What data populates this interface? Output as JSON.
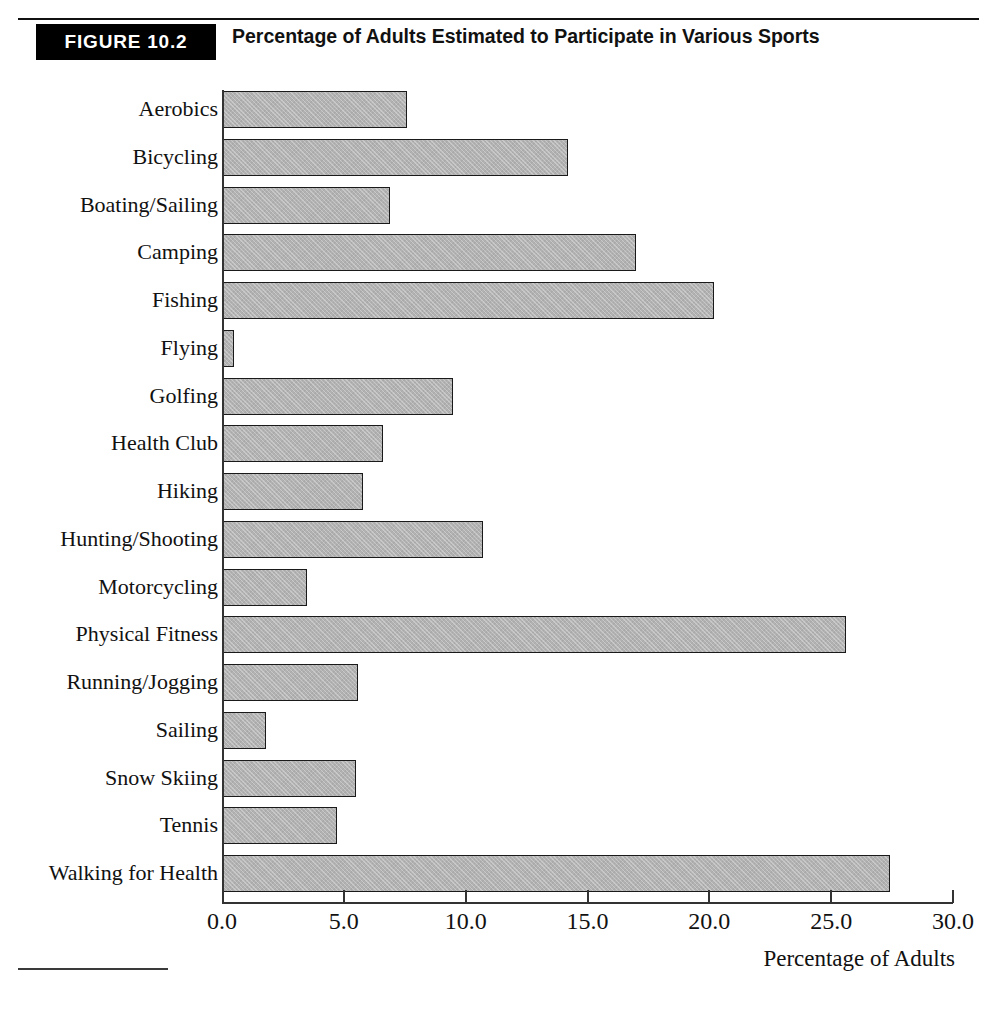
{
  "figure": {
    "badge": "FIGURE 10.2",
    "title": "Percentage of Adults Estimated to Participate in Various Sports"
  },
  "axis": {
    "x_title": "Percentage of Adults",
    "tick_labels": [
      "0.0",
      "5.0",
      "10.0",
      "15.0",
      "20.0",
      "25.0",
      "30.0"
    ]
  },
  "colors": {
    "bar_fill": "#b2b2b2",
    "bar_border": "#1a1a1a",
    "badge_background": "#000000",
    "badge_text": "#ffffff",
    "axis": "#333333",
    "text": "#111111"
  },
  "chart_data": {
    "type": "bar",
    "orientation": "horizontal",
    "title": "Percentage of Adults Estimated to Participate in Various Sports",
    "xlabel": "Percentage of Adults",
    "ylabel": "",
    "xlim": [
      0.0,
      30.0
    ],
    "xticks": [
      0.0,
      5.0,
      10.0,
      15.0,
      20.0,
      25.0,
      30.0
    ],
    "grid": false,
    "legend": false,
    "categories": [
      "Aerobics",
      "Bicycling",
      "Boating/Sailing",
      "Camping",
      "Fishing",
      "Flying",
      "Golfing",
      "Health Club",
      "Hiking",
      "Hunting/Shooting",
      "Motorcycling",
      "Physical Fitness",
      "Running/Jogging",
      "Sailing",
      "Snow Skiing",
      "Tennis",
      "Walking for Health"
    ],
    "values": [
      7.6,
      14.2,
      6.9,
      17.0,
      20.2,
      0.5,
      9.5,
      6.6,
      5.8,
      10.7,
      3.5,
      25.6,
      5.6,
      1.8,
      5.5,
      4.7,
      27.4
    ]
  }
}
